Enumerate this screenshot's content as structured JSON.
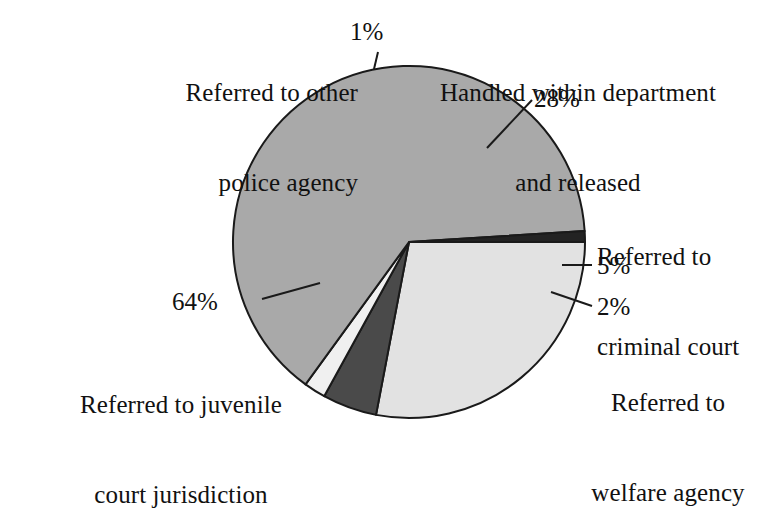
{
  "chart_data": {
    "type": "pie",
    "title": "",
    "subtitle": "",
    "xlabel": "",
    "ylabel": "",
    "legend_position": "none",
    "grid": false,
    "units": "percent",
    "categories": [
      "Handled within department and released",
      "Referred to criminal court",
      "Referred to welfare agency",
      "Referred to juvenile court jurisdiction",
      "Referred to other police agency"
    ],
    "values": [
      28,
      5,
      2,
      64,
      1
    ],
    "value_labels": [
      "28%",
      "5%",
      "2%",
      "64%",
      "1%"
    ],
    "colors": [
      "#e2e2e2",
      "#4a4a4a",
      "#f0f0f0",
      "#a9a9a9",
      "#232323"
    ],
    "slices": [
      {
        "id": "handled-within-department",
        "label": "Handled within department\nand released",
        "label_line1": "Handled within department",
        "label_line2": "and released",
        "percent": 28,
        "value_label": "28%",
        "color": "#e2e2e2",
        "start_angle_deg": 0,
        "end_angle_deg": 100.8
      },
      {
        "id": "referred-to-criminal-court",
        "label": "Referred to\ncriminal court",
        "label_line1": "Referred to",
        "label_line2": "criminal court",
        "percent": 5,
        "value_label": "5%",
        "color": "#4a4a4a",
        "start_angle_deg": 100.8,
        "end_angle_deg": 118.8
      },
      {
        "id": "referred-to-welfare-agency",
        "label": "Referred to\nwelfare agency",
        "label_line1": "Referred to",
        "label_line2": "welfare agency",
        "percent": 2,
        "value_label": "2%",
        "color": "#f0f0f0",
        "start_angle_deg": 118.8,
        "end_angle_deg": 126.0
      },
      {
        "id": "referred-to-juvenile-court",
        "label": "Referred to juvenile\ncourt jurisdiction",
        "label_line1": "Referred to juvenile",
        "label_line2": "court jurisdiction",
        "percent": 64,
        "value_label": "64%",
        "color": "#a9a9a9",
        "start_angle_deg": 126.0,
        "end_angle_deg": 356.4
      },
      {
        "id": "referred-to-other-police-agency",
        "label": "Referred to other\npolice agency",
        "label_line1": "Referred to other",
        "label_line2": "police agency",
        "percent": 1,
        "value_label": "1%",
        "color": "#232323",
        "start_angle_deg": 356.4,
        "end_angle_deg": 360
      }
    ],
    "geometry": {
      "center_x": 409,
      "center_y": 242,
      "radius": 176,
      "stroke_color": "#1a1a1a",
      "stroke_width": 2,
      "background": "#ffffff"
    }
  },
  "labels": {
    "police_agency": {
      "line1": "Referred to other",
      "line2": "police agency",
      "pct": "1%"
    },
    "handled": {
      "line1": "Handled within department",
      "line2": "and released",
      "pct": "28%"
    },
    "criminal_court": {
      "line1": "Referred to",
      "line2": "criminal court",
      "pct": "5%"
    },
    "welfare_agency": {
      "line1": "Referred to",
      "line2": "welfare agency",
      "pct": "2%"
    },
    "juvenile_court": {
      "line1": "Referred to juvenile",
      "line2": "court jurisdiction",
      "pct": "64%"
    }
  }
}
